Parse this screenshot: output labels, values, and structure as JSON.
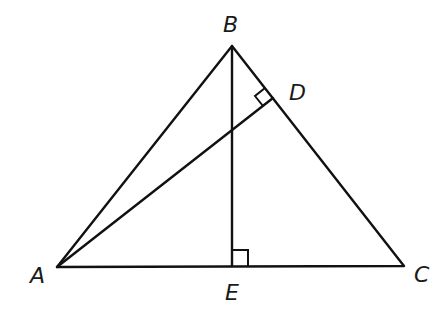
{
  "diagram": {
    "type": "geometry-triangle",
    "points": {
      "A": {
        "label": "A",
        "x": 57,
        "y": 267
      },
      "B": {
        "label": "B",
        "x": 232,
        "y": 46
      },
      "C": {
        "label": "C",
        "x": 404,
        "y": 266
      },
      "D": {
        "label": "D",
        "x": 273,
        "y": 98
      },
      "E": {
        "label": "E",
        "x": 232,
        "y": 266
      }
    },
    "segments": [
      "AB",
      "BC",
      "CA",
      "AD",
      "BE"
    ],
    "right_angles": [
      "ADB",
      "BEC"
    ],
    "labels": {
      "A": "A",
      "B": "B",
      "C": "C",
      "D": "D",
      "E": "E"
    },
    "stroke_color": "#111111"
  }
}
